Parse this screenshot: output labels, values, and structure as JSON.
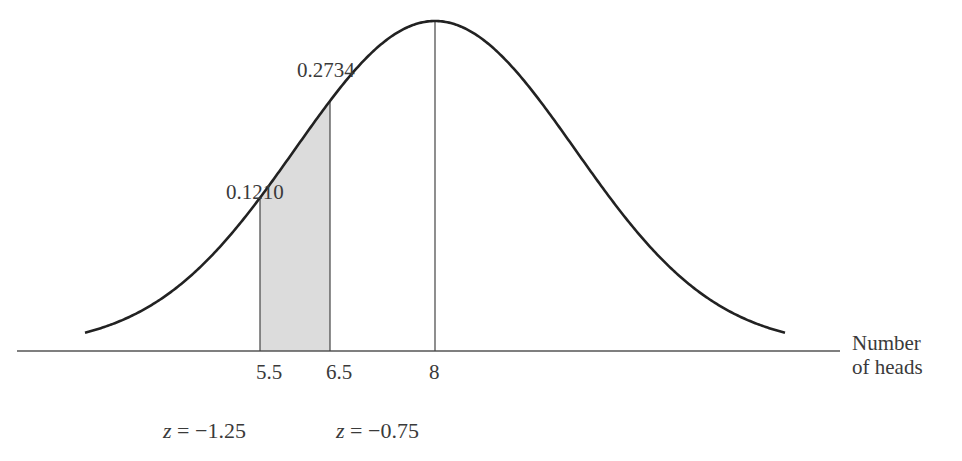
{
  "chart_data": {
    "type": "area",
    "title": "",
    "mean": 8,
    "std_dev": 2,
    "xlabel": "Number of heads",
    "ylabel": "",
    "x_ticks": [
      5.5,
      6.5,
      8
    ],
    "shaded_interval": [
      5.5,
      6.5
    ],
    "annotations": [
      {
        "text": "0.2734",
        "refers_to": "area left of 6.5 (z = -0.75)"
      },
      {
        "text": "0.1210",
        "refers_to": "area left of 5.5 (z = -1.25)"
      }
    ],
    "z_values": [
      {
        "x": 5.5,
        "z": -1.25
      },
      {
        "x": 6.5,
        "z": -0.75
      }
    ],
    "grid": false,
    "legend": null
  },
  "labels": {
    "area_upper": "0.2734",
    "area_lower": "0.1210",
    "tick_55": "5.5",
    "tick_65": "6.5",
    "tick_8": "8",
    "axis_title_line1": "Number",
    "axis_title_line2": "of heads",
    "z_var": "z",
    "z_eq": " = ",
    "z1_value": "−1.25",
    "z2_value": "−0.75"
  },
  "colors": {
    "curve": "#222222",
    "axis": "#555555",
    "shade": "#dcdcdc",
    "text": "#3a3a3a"
  }
}
